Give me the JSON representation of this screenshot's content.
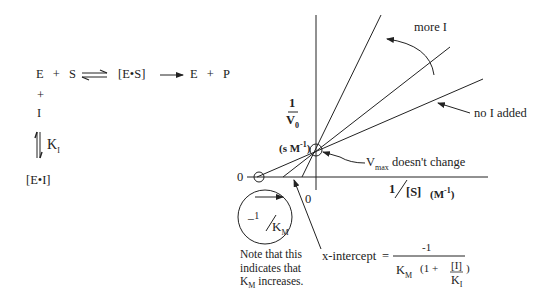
{
  "scheme": {
    "row1": {
      "E": "E",
      "plus1": "+",
      "S": "S",
      "ES": "[E•S]",
      "E2": "E",
      "plus2": "+",
      "P": "P"
    },
    "plus_vertical": "+",
    "I": "I",
    "KI_label": "K",
    "KI_sub": "I",
    "EI": "[E•I]"
  },
  "plot": {
    "y_label_numerator": "1",
    "y_label_denominator": "V",
    "y_label_denominator_sub": "0",
    "y_units": "(s M",
    "y_units_sup": "-1",
    "y_units_close": ")",
    "x_label_num": "1",
    "x_label_den": "[S]",
    "x_units": "(M",
    "x_units_sup": "-1",
    "x_units_close": ")",
    "origin_x_zero": "0",
    "origin_y_zero": "0"
  },
  "annotations": {
    "more_I": "more I",
    "no_I_added": "no I added",
    "vmax_prefix": "V",
    "vmax_sub": "max",
    "vmax_suffix": " doesn't change",
    "circle_label_minus": "−",
    "circle_label_num": "1",
    "circle_label_den": "K",
    "circle_label_den_sub": "M",
    "note_line1": "Note that this",
    "note_line2": "indicates that",
    "note_line3_prefix": "K",
    "note_line3_sub": "M",
    "note_line3_suffix": " increases.",
    "x_intercept_label": "x-intercept",
    "equals": "=",
    "formula_numerator": "-1",
    "formula_KM": "K",
    "formula_KM_sub": "M",
    "formula_open": "(1 +",
    "formula_I": "[I]",
    "formula_KI": "K",
    "formula_KI_sub": "I",
    "formula_close": ")"
  },
  "colors": {
    "ink": "#222222",
    "background": "#ffffff"
  }
}
